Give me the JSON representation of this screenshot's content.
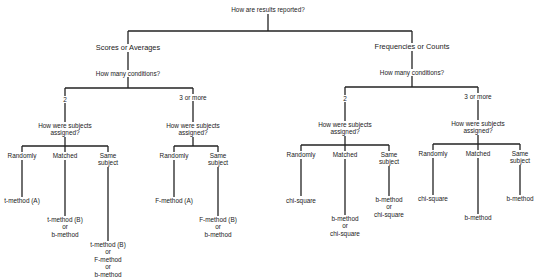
{
  "diagram": {
    "type": "decision-tree",
    "root": "How are results reported?",
    "branches": {
      "scores": {
        "label": "Scores or Averages",
        "question": "How many conditions?",
        "two": {
          "label": "2",
          "question_line1": "How were subjects",
          "question_line2": "assigned?",
          "randomly": {
            "label": "Randomly",
            "result": "t-method (A)"
          },
          "matched": {
            "label": "Matched",
            "result_lines": [
              "t-method (B)",
              "or",
              "b-method"
            ]
          },
          "same": {
            "label_line1": "Same",
            "label_line2": "subject",
            "result_lines": [
              "t-method (B)",
              "or",
              "F-method",
              "or",
              "b-method"
            ]
          }
        },
        "three": {
          "label": "3 or more",
          "question_line1": "How were subjects",
          "question_line2": "assigned?",
          "randomly": {
            "label": "Randomly",
            "result": "F-method (A)"
          },
          "same": {
            "label_line1": "Same",
            "label_line2": "subject",
            "result_lines": [
              "F-method (B)",
              "or",
              "b-method"
            ]
          }
        }
      },
      "frequencies": {
        "label": "Frequencies or Counts",
        "question": "How many conditions?",
        "two": {
          "label": "2",
          "question_line1": "How were subjects",
          "question_line2": "assigned?",
          "randomly": {
            "label": "Randomly",
            "result": "chi-square"
          },
          "matched": {
            "label": "Matched",
            "result_lines": [
              "b-method",
              "or",
              "chi-square"
            ]
          },
          "same": {
            "label_line1": "Same",
            "label_line2": "subject",
            "result_lines": [
              "b-method",
              "or",
              "chi-square"
            ]
          }
        },
        "three": {
          "label": "3 or more",
          "question_line1": "How were subjects",
          "question_line2": "assigned?",
          "randomly": {
            "label": "Randomly",
            "result": "chi-square"
          },
          "matched": {
            "label": "Matched",
            "result": "b-method"
          },
          "same": {
            "label_line1": "Same",
            "label_line2": "subject",
            "result": "b-method"
          }
        }
      }
    }
  }
}
